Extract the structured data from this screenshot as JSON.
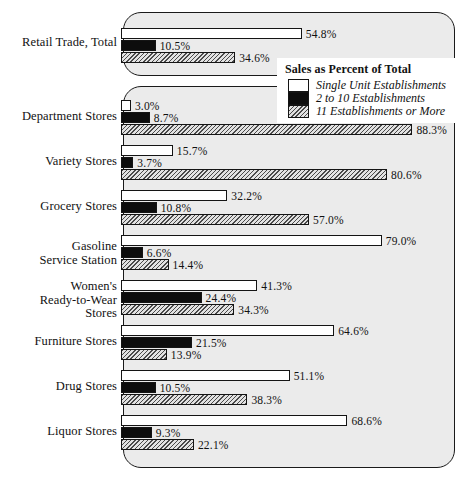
{
  "chart_data": {
    "type": "bar",
    "title": "Sales as Percent of Total",
    "xlabel": "",
    "ylabel": "",
    "xlim": [
      0,
      100
    ],
    "grid": false,
    "orientation": "horizontal",
    "legend_position": "top-right",
    "value_suffix": "%",
    "categories": [
      "Retail Trade, Total",
      "Department Stores",
      "Variety Stores",
      "Grocery Stores",
      "Gasoline\nService Station",
      "Women's\nReady-to-Wear\nStores",
      "Furniture Stores",
      "Drug Stores",
      "Liquor Stores"
    ],
    "series": [
      {
        "name": "Single Unit Establishments",
        "swatch": "s1",
        "values": [
          54.8,
          3.0,
          15.7,
          32.2,
          79.0,
          41.3,
          64.6,
          51.1,
          68.6
        ],
        "labels": [
          "54.8%",
          "3.0%",
          "15.7%",
          "32.2%",
          "79.0%",
          "41.3%",
          "64.6%",
          "51.1%",
          "68.6%"
        ]
      },
      {
        "name": "2 to 10 Establishments",
        "swatch": "s2",
        "values": [
          10.5,
          8.7,
          3.7,
          10.8,
          6.6,
          24.4,
          21.5,
          10.5,
          9.3
        ],
        "labels": [
          "10.5%",
          "8.7%",
          "3.7%",
          "10.8%",
          "6.6%",
          "24.4%",
          "21.5%",
          "10.5%",
          "9.3%"
        ]
      },
      {
        "name": "11 Establishments or More",
        "swatch": "s3",
        "values": [
          34.6,
          88.3,
          80.6,
          57.0,
          14.4,
          34.3,
          13.9,
          38.3,
          22.1
        ],
        "labels": [
          "34.6%",
          "88.3%",
          "80.6%",
          "57.0%",
          "14.4%",
          "34.3%",
          "13.9%",
          "38.3%",
          "22.1%"
        ]
      }
    ]
  },
  "legend": {
    "title": "Sales as Percent of Total",
    "items": [
      {
        "label": "Single Unit Establishments",
        "swatch": "s1"
      },
      {
        "label": "2 to 10 Establishments",
        "swatch": "s2"
      },
      {
        "label": "11 Establishments or More",
        "swatch": "s3"
      }
    ]
  },
  "panels": {
    "top_group_count": 1,
    "main_group_count": 8
  }
}
